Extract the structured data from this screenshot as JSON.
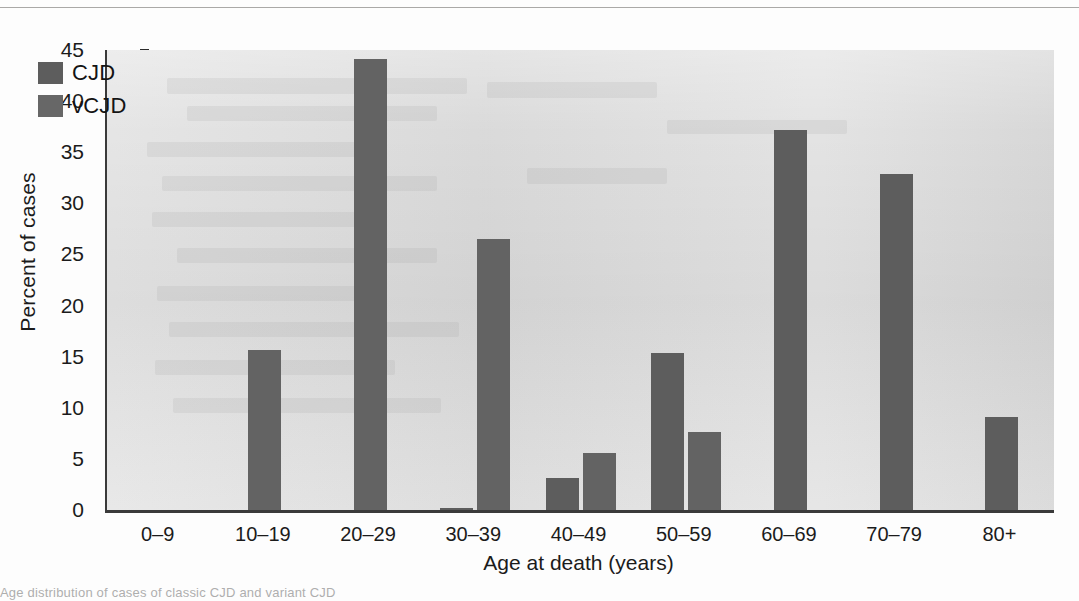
{
  "figure": {
    "ylabel": "Percent of cases",
    "xlabel": "Age at death (years)",
    "legend": [
      {
        "key": "cjd",
        "label": "CJD",
        "color": "#5d5d5d"
      },
      {
        "key": "vcjd",
        "label": "vCJD",
        "color": "#676767"
      }
    ],
    "yticks": [
      "0",
      "5",
      "10",
      "15",
      "20",
      "25",
      "30",
      "35",
      "40",
      "45"
    ],
    "panel_color": "#dedede",
    "axis_color": "#3a3a3a"
  },
  "caption": {
    "ghost_text": "Age distribution of cases of classic CJD and variant CJD"
  },
  "chart_data": {
    "type": "bar",
    "title": "",
    "xlabel": "Age at death (years)",
    "ylabel": "Percent of cases",
    "categories": [
      "0–9",
      "10–19",
      "20–29",
      "30–39",
      "40–49",
      "50–59",
      "60–69",
      "70–79",
      "80+"
    ],
    "series": [
      {
        "name": "CJD",
        "color": "#5d5d5d",
        "values": [
          0,
          0,
          0,
          0.2,
          3.1,
          15.4,
          37.2,
          32.9,
          9.1
        ]
      },
      {
        "name": "vCJD",
        "color": "#676767",
        "values": [
          0,
          15.7,
          44.1,
          26.5,
          5.6,
          7.6,
          0,
          0,
          0
        ]
      }
    ],
    "ylim": [
      0,
      45
    ],
    "ytick_step": 5,
    "grid": false,
    "legend_position": "top-left"
  }
}
